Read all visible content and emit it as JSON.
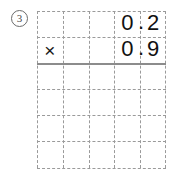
{
  "worksheet": {
    "problem_number": "3",
    "problem_number_style": "circled",
    "grid": {
      "columns": 5,
      "rows": 6
    },
    "operation": {
      "operator": "×",
      "operand_1": "0.2",
      "operand_2": "0.9",
      "answer": ""
    },
    "cells": {
      "row1": [
        "",
        "",
        "",
        "0",
        "2"
      ],
      "row2": [
        "×",
        "",
        "",
        "0",
        "9"
      ],
      "row3": [
        "",
        "",
        "",
        "",
        ""
      ],
      "row4": [
        "",
        "",
        "",
        "",
        ""
      ],
      "row5": [
        "",
        "",
        "",
        "",
        ""
      ],
      "row6": [
        "",
        "",
        "",
        "",
        ""
      ]
    },
    "decimal_points": {
      "row1": ".",
      "row2": "."
    },
    "colors": {
      "grid_line": "#9a9a9a",
      "answer_rule": "#8c8c8c",
      "digit": "#111111",
      "background": "#ffffff",
      "problem_number": "#4a4a4a"
    }
  }
}
